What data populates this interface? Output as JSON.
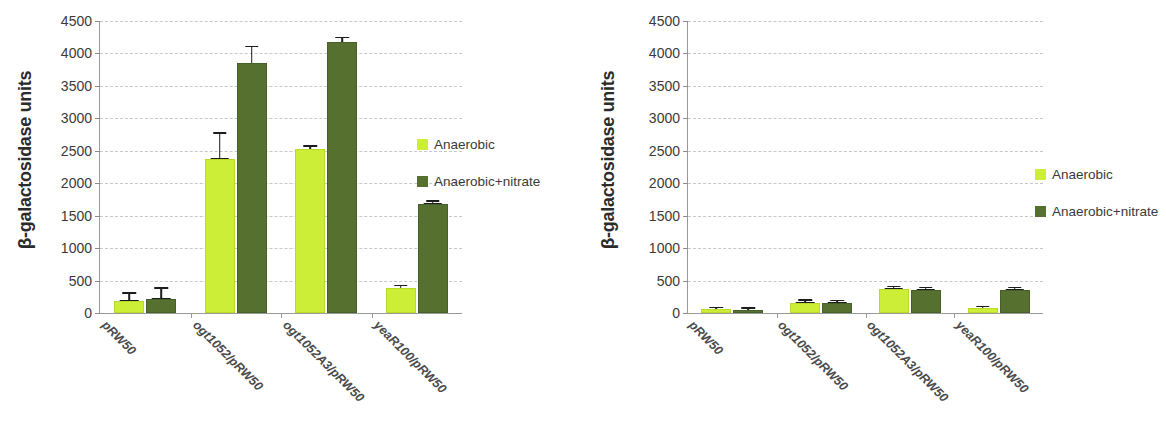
{
  "chart_data": [
    {
      "panel": "left",
      "type": "bar",
      "title": "",
      "xlabel": "",
      "ylabel": "β-galactosidase units",
      "ylim": [
        0,
        4500
      ],
      "yticks": [
        0,
        500,
        1000,
        1500,
        2000,
        2500,
        3000,
        3500,
        4000,
        4500
      ],
      "ytick_labels": [
        "0",
        "500",
        "1000",
        "1500",
        "2000",
        "2500",
        "3000",
        "3500",
        "4000",
        "4500"
      ],
      "grid": true,
      "legend_position": "right",
      "categories": [
        "pRW50",
        "ogt1052/pRW50",
        "ogt1052A3/pRW50",
        "yeaR100/pRW50"
      ],
      "series": [
        {
          "name": "Anaerobic",
          "color": "#cdee36",
          "values": [
            190,
            2380,
            2520,
            380
          ],
          "errors": [
            60,
            200,
            30,
            25
          ]
        },
        {
          "name": "Anaerobic+nitrate",
          "color": "#55702f",
          "values": [
            220,
            3850,
            4170,
            1680
          ],
          "errors": [
            85,
            130,
            40,
            25
          ]
        }
      ]
    },
    {
      "panel": "right",
      "type": "bar",
      "title": "",
      "xlabel": "",
      "ylabel": "β-galactosidase units",
      "ylim": [
        0,
        4500
      ],
      "yticks": [
        0,
        500,
        1000,
        1500,
        2000,
        2500,
        3000,
        3500,
        4000,
        4500
      ],
      "ytick_labels": [
        "0",
        "500",
        "1000",
        "1500",
        "2000",
        "2500",
        "3000",
        "3500",
        "4000",
        "4500"
      ],
      "grid": true,
      "legend_position": "right",
      "categories": [
        "pRW50",
        "ogt1052/pRW50",
        "ogt1052A3/pRW50",
        "yeaR100/pRW50"
      ],
      "series": [
        {
          "name": "Anaerobic",
          "color": "#cdee36",
          "values": [
            55,
            155,
            370,
            70
          ],
          "errors": [
            18,
            25,
            22,
            18
          ]
        },
        {
          "name": "Anaerobic+nitrate",
          "color": "#55702f",
          "values": [
            45,
            155,
            355,
            355
          ],
          "errors": [
            18,
            22,
            22,
            22
          ]
        }
      ]
    }
  ],
  "panels": {
    "left": {
      "axis_title": "β-galactosidase units",
      "axis_title_beta": "β",
      "axis_title_rest": "-galactosidase units",
      "legend": {
        "items": [
          {
            "label": "Anaerobic",
            "color": "#cdee36"
          },
          {
            "label": "Anaerobic+nitrate",
            "color": "#55702f"
          }
        ]
      }
    },
    "right": {
      "axis_title": "β-galactosidase units",
      "axis_title_beta": "β",
      "axis_title_rest": "-galactosidase units",
      "legend": {
        "items": [
          {
            "label": "Anaerobic",
            "color": "#cdee36"
          },
          {
            "label": "Anaerobic+nitrate",
            "color": "#55702f"
          }
        ]
      }
    }
  }
}
